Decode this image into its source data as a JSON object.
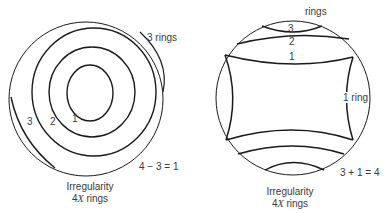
{
  "left_panel": {
    "ring_labels": [
      "1",
      "2",
      "3"
    ],
    "side_label": "3 rings",
    "equation": "4 − 3 = 1",
    "caption_line1": "Irregularity",
    "caption_prefix": "4",
    "caption_var": "X",
    "caption_suffix": " rings"
  },
  "right_panel": {
    "top_label": "rings",
    "ring_labels": [
      "3",
      "2",
      "1"
    ],
    "side_label": "1 ring",
    "equation": "3 + 1 = 4",
    "caption_line1": "Irregularity",
    "caption_prefix": "4",
    "caption_var": "X",
    "caption_suffix": " rings"
  },
  "colors": {
    "line": "#1a1a1a",
    "text": "#3a3a3a",
    "background": "#ffffff"
  }
}
